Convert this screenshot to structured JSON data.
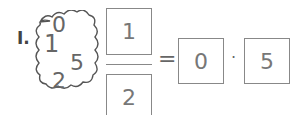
{
  "problem": {
    "label": "I.",
    "cloud_digits": [
      "0",
      "1",
      "5",
      "2"
    ],
    "numerator": "1",
    "denominator": "2",
    "equals": "=",
    "decimal_whole": "0",
    "decimal_point": "·",
    "decimal_tenths": "5"
  }
}
